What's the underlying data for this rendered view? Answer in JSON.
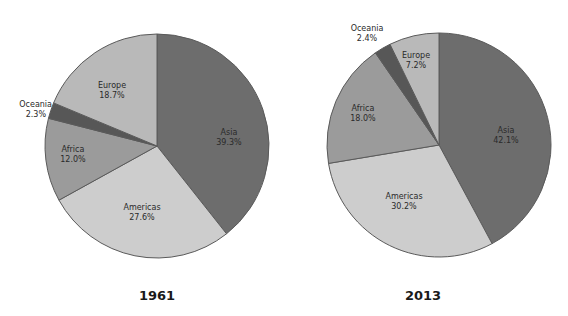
{
  "chart_data": [
    {
      "type": "pie",
      "title": "1961",
      "categories": [
        "Asia",
        "Americas",
        "Africa",
        "Oceania",
        "Europe"
      ],
      "values": [
        39.3,
        27.6,
        12.0,
        2.3,
        18.7
      ],
      "labels": [
        "39.3%",
        "27.6%",
        "12.0%",
        "2.3%",
        "18.7%"
      ],
      "colors": [
        "#6d6d6d",
        "#cdcdcd",
        "#9b9b9b",
        "#575757",
        "#b9b9b9"
      ],
      "start_angle": "12 o'clock",
      "direction": "clockwise"
    },
    {
      "type": "pie",
      "title": "2013",
      "categories": [
        "Asia",
        "Americas",
        "Africa",
        "Oceania",
        "Europe"
      ],
      "values": [
        42.1,
        30.2,
        18.0,
        2.4,
        7.2
      ],
      "labels": [
        "42.1%",
        "30.2%",
        "18.0%",
        "2.4%",
        "7.2%"
      ],
      "colors": [
        "#6d6d6d",
        "#cdcdcd",
        "#9b9b9b",
        "#575757",
        "#b9b9b9"
      ],
      "start_angle": "12 o'clock",
      "direction": "clockwise"
    }
  ],
  "charts": [
    {
      "year": "1961",
      "slices": [
        {
          "name": "Asia",
          "pct": "39.3%"
        },
        {
          "name": "Americas",
          "pct": "27.6%"
        },
        {
          "name": "Africa",
          "pct": "12.0%"
        },
        {
          "name": "Oceania",
          "pct": "2.3%"
        },
        {
          "name": "Europe",
          "pct": "18.7%"
        }
      ]
    },
    {
      "year": "2013",
      "slices": [
        {
          "name": "Asia",
          "pct": "42.1%"
        },
        {
          "name": "Americas",
          "pct": "30.2%"
        },
        {
          "name": "Africa",
          "pct": "18.0%"
        },
        {
          "name": "Oceania",
          "pct": "2.4%"
        },
        {
          "name": "Europe",
          "pct": "7.2%"
        }
      ]
    }
  ]
}
